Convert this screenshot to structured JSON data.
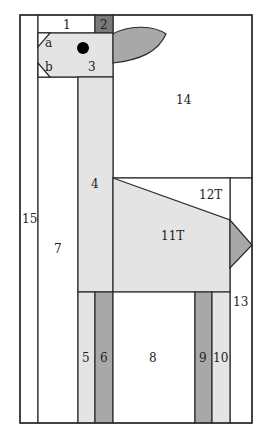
{
  "diagram": {
    "title": "",
    "colors": {
      "outline": "#2a2a2a",
      "white": "#ffffff",
      "light": "#e4e4e4",
      "medium": "#a8a8a8",
      "dark": "#7a7a7a",
      "eye": "#000000"
    },
    "pieces": [
      {
        "id": "1",
        "label": "1"
      },
      {
        "id": "2",
        "label": "2"
      },
      {
        "id": "a",
        "label": "a"
      },
      {
        "id": "b",
        "label": "b"
      },
      {
        "id": "3",
        "label": "3"
      },
      {
        "id": "4",
        "label": "4"
      },
      {
        "id": "5",
        "label": "5"
      },
      {
        "id": "6",
        "label": "6"
      },
      {
        "id": "7",
        "label": "7"
      },
      {
        "id": "8",
        "label": "8"
      },
      {
        "id": "9",
        "label": "9"
      },
      {
        "id": "10",
        "label": "10"
      },
      {
        "id": "11T",
        "label": "11T"
      },
      {
        "id": "12T",
        "label": "12T"
      },
      {
        "id": "13",
        "label": "13"
      },
      {
        "id": "14",
        "label": "14"
      },
      {
        "id": "15",
        "label": "15"
      }
    ]
  }
}
